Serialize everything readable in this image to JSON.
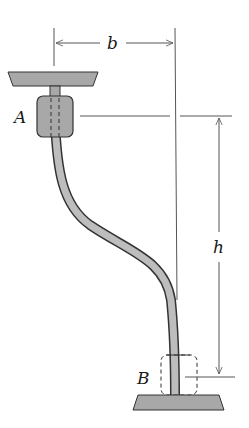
{
  "diagram": {
    "type": "mechanics-figure",
    "labels": {
      "point_a": "A",
      "point_b": "B",
      "dim_horizontal": "b",
      "dim_vertical": "h"
    },
    "dimensions": [
      {
        "name": "b",
        "direction": "horizontal",
        "from": "centerline of A",
        "to": "centerline of B"
      },
      {
        "name": "h",
        "direction": "vertical",
        "from": "level of A",
        "to": "level of B"
      }
    ],
    "colors": {
      "fill_gray": "#a8a8a8",
      "outline": "#333333",
      "dimension_line": "#555555",
      "background": "#ffffff"
    }
  }
}
